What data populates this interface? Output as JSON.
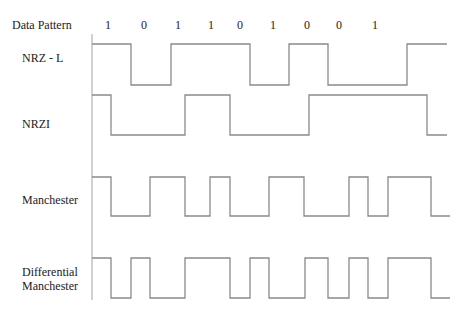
{
  "header": {
    "title": "Data Pattern",
    "bits": [
      "1",
      "0",
      "1",
      "1",
      "0",
      "1",
      "0",
      "0",
      "1"
    ]
  },
  "rows": [
    {
      "label": "NRZ - L"
    },
    {
      "label": "NRZI"
    },
    {
      "label": "Manchester"
    },
    {
      "label_line1": "Differential",
      "label_line2": "Manchester"
    }
  ],
  "colors": {
    "waveform": "#8a8a8a",
    "axis": "#b8b8b8",
    "text": "#222222"
  }
}
